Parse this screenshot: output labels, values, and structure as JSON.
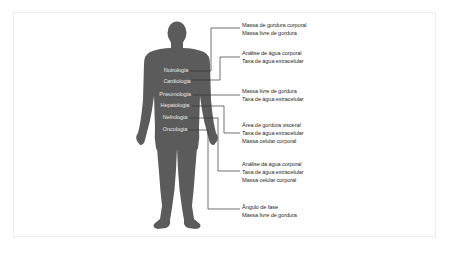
{
  "colors": {
    "silhouette": "#5b5b5b",
    "connector": "#333333",
    "body_label_text": "#e6e6e6",
    "annotation_text": "#2a2a2a",
    "panel_border": "#ececec"
  },
  "body_labels": [
    {
      "label": "Nutrologia"
    },
    {
      "label": "Cardiologia"
    },
    {
      "label": "Pneumologia"
    },
    {
      "label": "Hepatologia"
    },
    {
      "label": "Nefrologia"
    },
    {
      "label": "Oncologia"
    }
  ],
  "annotations": [
    {
      "lines": [
        "Massa de gordura corporal",
        "Massa livre de gordura"
      ]
    },
    {
      "lines": [
        "Análise de água corporal",
        "Taxa de água extracelular"
      ]
    },
    {
      "lines": [
        "Massa livre de gordura",
        "Taxa de água extracelular"
      ]
    },
    {
      "lines": [
        "Área de gordura visceral",
        "Taxa de água extracelular",
        "Massa celular corporal"
      ]
    },
    {
      "lines": [
        "Análise da água corporal",
        "Taxa de água extracelular",
        "Massa celular corporal"
      ]
    },
    {
      "lines": [
        "Ângulo de fase",
        "Massa livre de gordura"
      ]
    }
  ]
}
